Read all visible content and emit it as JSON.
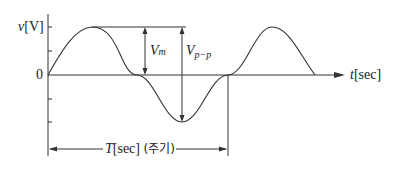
{
  "diagram": {
    "type": "sine-waveform",
    "y_axis_label": "v[V]",
    "y_axis_label_var": "v",
    "y_axis_label_unit": "[V]",
    "origin_label": "0",
    "x_axis_label_var": "t",
    "x_axis_label_unit": "[sec]",
    "amplitude_label_main": "V",
    "amplitude_label_sub": "m",
    "peak_to_peak_label_main": "V",
    "peak_to_peak_label_sub": "p−p",
    "period_label_var": "T",
    "period_label_unit": "[sec]",
    "period_label_korean": "(주기)",
    "line_color": "#333333"
  }
}
